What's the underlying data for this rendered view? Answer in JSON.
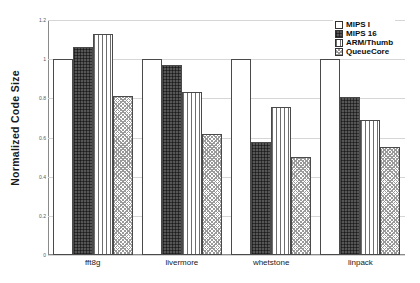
{
  "chart_data": {
    "type": "bar",
    "title": "",
    "xlabel": "",
    "ylabel": "Normalized Code Size",
    "categories": [
      "fft8g",
      "livermore",
      "whetstone",
      "linpack"
    ],
    "series": [
      {
        "name": "MIPS I",
        "values": [
          1.0,
          1.0,
          1.0,
          1.0
        ],
        "pattern": "solid-white",
        "color": "#ffffff"
      },
      {
        "name": "MIPS 16",
        "values": [
          1.06,
          0.97,
          0.575,
          0.805
        ],
        "pattern": "dark-crosshatch",
        "color": "#565656"
      },
      {
        "name": "ARM/Thumb",
        "values": [
          1.13,
          0.83,
          0.755,
          0.69
        ],
        "pattern": "vertical-stripes",
        "color": "#6e6e6e"
      },
      {
        "name": "QueueCore",
        "values": [
          0.81,
          0.62,
          0.5,
          0.55
        ],
        "pattern": "fine-checker",
        "color": "#9a9a9a"
      }
    ],
    "ylim": [
      0,
      1.2
    ],
    "yticks": [
      0,
      0.2,
      0.4,
      0.6,
      0.8,
      1,
      1.2
    ],
    "ytick_labels": [
      "0",
      "0.2",
      "0.4",
      "0.6",
      "0.8",
      "1",
      "1.2"
    ],
    "grid": true,
    "legend_position": "top-right"
  },
  "axes": {
    "y_title": "Normalized Code Size"
  },
  "legend": {
    "items": [
      {
        "label": "MIPS I"
      },
      {
        "label": "MIPS 16"
      },
      {
        "label": "ARM/Thumb"
      },
      {
        "label": "QueueCore"
      }
    ]
  }
}
